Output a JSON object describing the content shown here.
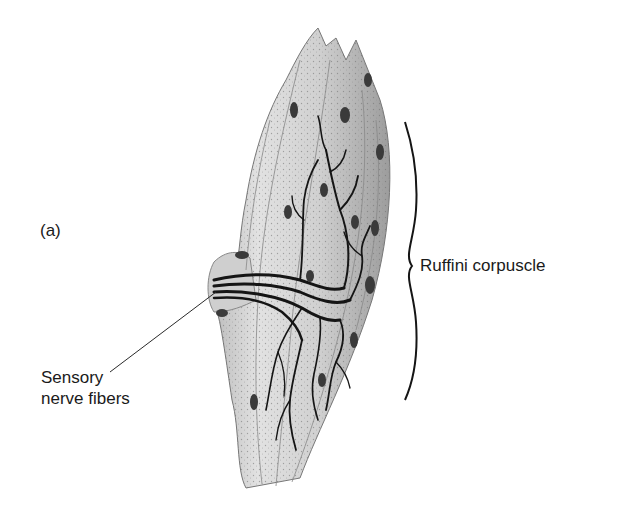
{
  "figure": {
    "panel_label": "(a)",
    "labels": {
      "ruffini": "Ruffini corpuscle",
      "sensory_line1": "Sensory",
      "sensory_line2": "nerve fibers"
    },
    "colors": {
      "background": "#ffffff",
      "ink": "#1a1a1a",
      "tissue_light": "#d9d9d9",
      "tissue_mid": "#a8a8a8",
      "nucleus": "#3a3a3a"
    }
  }
}
